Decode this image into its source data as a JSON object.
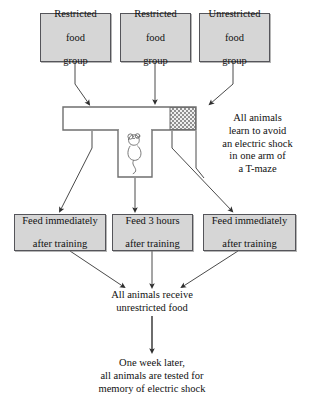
{
  "diagram": {
    "colors": {
      "box_fill": "#d6d6d6",
      "box_border": "#55555a",
      "arrow": "#3a3a3a",
      "maze_stroke": "#6a6a6a",
      "shock_zone": "#8a8a8a",
      "background": "#ffffff"
    },
    "groups": [
      {
        "id": "restricted-1",
        "line1": "Restricted",
        "line2": "food",
        "line3": "group"
      },
      {
        "id": "restricted-2",
        "line1": "Restricted",
        "line2": "food",
        "line3": "group"
      },
      {
        "id": "unrestricted-1",
        "line1": "Unrestricted",
        "line2": "food",
        "line3": "group"
      }
    ],
    "maze": {
      "label": "t-maze",
      "animal": "mouse",
      "shock_zone_label": "electric shock arm"
    },
    "maze_caption": {
      "line1": "All animals",
      "line2": "learn to avoid",
      "line3": "an electric shock",
      "line4": "in one arm of",
      "line5": "a T-maze"
    },
    "feeding": [
      {
        "id": "feed-immediately-1",
        "line1": "Feed immediately",
        "line2": "after training"
      },
      {
        "id": "feed-3-hours",
        "line1": "Feed 3 hours",
        "line2": "after training"
      },
      {
        "id": "feed-immediately-2",
        "line1": "Feed immediately",
        "line2": "after training"
      }
    ],
    "unrestricted_step": {
      "line1": "All animals receive",
      "line2": "unrestricted food"
    },
    "test_step": {
      "line1": "One week later,",
      "line2": "all animals are tested for",
      "line3": "memory of electric shock"
    }
  }
}
